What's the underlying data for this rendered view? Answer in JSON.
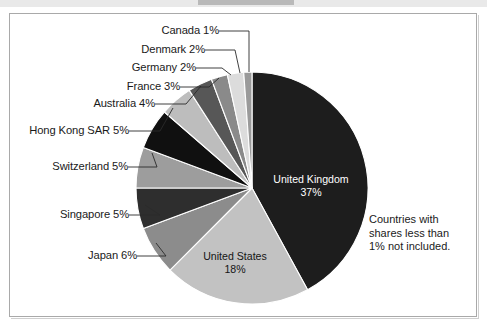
{
  "figure": {
    "background": "#ffffff",
    "frame_color": "#a9a9a9",
    "note": "Countries with\nshares less than\n1% not included."
  },
  "chart_data": {
    "type": "pie",
    "title": "",
    "subtitle": "",
    "xlabel": "",
    "ylabel": "",
    "legend_position": "none",
    "grid": false,
    "annotations": [
      "Countries with shares less than 1% not included."
    ],
    "start_angle_deg": 0,
    "direction": "clockwise",
    "categories": [
      "United Kingdom",
      "United States",
      "Japan",
      "Singapore",
      "Switzerland",
      "Hong Kong SAR",
      "Australia",
      "France",
      "Germany",
      "Denmark",
      "Canada"
    ],
    "values": [
      37,
      18,
      6,
      5,
      5,
      5,
      4,
      3,
      2,
      2,
      1
    ],
    "unit": "%",
    "slices": [
      {
        "label": "United Kingdom",
        "value": 37,
        "text": "United Kingdom",
        "percent": "37%",
        "color": "#1d1d1d",
        "label_placement": "inside",
        "label_color": "#ffffff"
      },
      {
        "label": "United States",
        "value": 18,
        "text": "United States",
        "percent": "18%",
        "color": "#c2c2c2",
        "label_placement": "inside",
        "label_color": "#151515"
      },
      {
        "label": "Japan",
        "value": 6,
        "text": "Japan 6%",
        "percent": "6%",
        "color": "#8c8c8c",
        "label_placement": "outside",
        "label_color": "#1a1a1a"
      },
      {
        "label": "Singapore",
        "value": 5,
        "text": "Singapore 5%",
        "percent": "5%",
        "color": "#2e2e2e",
        "label_placement": "outside",
        "label_color": "#1a1a1a"
      },
      {
        "label": "Switzerland",
        "value": 5,
        "text": "Switzerland 5%",
        "percent": "5%",
        "color": "#9d9d9d",
        "label_placement": "outside",
        "label_color": "#1a1a1a"
      },
      {
        "label": "Hong Kong SAR",
        "value": 5,
        "text": "Hong Kong SAR 5%",
        "percent": "5%",
        "color": "#101010",
        "label_placement": "outside",
        "label_color": "#1a1a1a"
      },
      {
        "label": "Australia",
        "value": 4,
        "text": "Australia 4%",
        "percent": "4%",
        "color": "#bdbdbd",
        "label_placement": "outside",
        "label_color": "#1a1a1a"
      },
      {
        "label": "France",
        "value": 3,
        "text": "France 3%",
        "percent": "3%",
        "color": "#575757",
        "label_placement": "outside",
        "label_color": "#1a1a1a"
      },
      {
        "label": "Germany",
        "value": 2,
        "text": "Germany 2%",
        "percent": "2%",
        "color": "#8a8a8a",
        "label_placement": "outside",
        "label_color": "#1a1a1a"
      },
      {
        "label": "Denmark",
        "value": 2,
        "text": "Denmark 2%",
        "percent": "2%",
        "color": "#dcdcdc",
        "label_placement": "outside",
        "label_color": "#1a1a1a"
      },
      {
        "label": "Canada",
        "value": 1,
        "text": "Canada 1%",
        "percent": "1%",
        "color": "#9a9a9a",
        "label_placement": "outside",
        "label_color": "#1a1a1a"
      }
    ]
  },
  "labels": {
    "canada": "Canada 1%",
    "denmark": "Denmark 2%",
    "germany": "Germany 2%",
    "france": "France 3%",
    "australia": "Australia 4%",
    "hong_kong": "Hong Kong SAR 5%",
    "switzerland": "Switzerland 5%",
    "singapore": "Singapore 5%",
    "japan": "Japan 6%",
    "united_kingdom_name": "United Kingdom",
    "united_kingdom_pct": "37%",
    "united_states_name": "United States",
    "united_states_pct": "18%"
  }
}
